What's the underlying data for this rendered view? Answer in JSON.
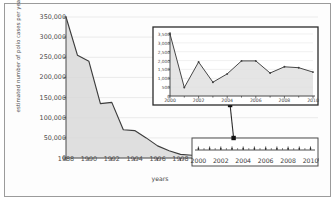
{
  "chart_data": {
    "type": "area",
    "title": "",
    "xlabel": "years",
    "ylabel": "estimated number of polio cases per year",
    "grid": true,
    "legend": "none",
    "xlim": [
      1988,
      2010
    ],
    "ylim": [
      0,
      350000
    ],
    "y_ticks": [
      "0",
      "50,000",
      "100,000",
      "150,000",
      "200,000",
      "250,000",
      "300,000",
      "350,000"
    ],
    "y_tick_values": [
      0,
      50000,
      100000,
      150000,
      200000,
      250000,
      300000,
      350000
    ],
    "x_ticks": [
      "1988",
      "1990",
      "1992",
      "1994",
      "1996",
      "1998",
      "2000",
      "2002",
      "2004",
      "2006",
      "2008",
      "2010"
    ],
    "x_tick_values": [
      1988,
      1990,
      1992,
      1994,
      1996,
      1998,
      2000,
      2002,
      2004,
      2006,
      2008,
      2010
    ],
    "x": [
      1988,
      1989,
      1990,
      1991,
      1992,
      1993,
      1994,
      1995,
      1996,
      1997,
      1998,
      1999,
      2000,
      2001,
      2002,
      2003,
      2004,
      2005,
      2006,
      2007,
      2008,
      2009,
      2010
    ],
    "values": [
      350000,
      255000,
      240000,
      135000,
      138000,
      70000,
      68000,
      50000,
      30000,
      18000,
      9000,
      7000,
      3500,
      480,
      1920,
      780,
      1250,
      1980,
      1980,
      1300,
      1650,
      1600,
      1350
    ],
    "series_color": "#3d3d3d",
    "fill_color": "#d9d9d9"
  },
  "inset_chart": {
    "type": "area",
    "title": "",
    "xlabel": "",
    "ylabel": "",
    "grid": true,
    "legend": "none",
    "xlim": [
      2000,
      2010
    ],
    "ylim": [
      0,
      3500
    ],
    "y_ticks": [
      "0",
      "500",
      "1,000",
      "1,500",
      "2,000",
      "2,500",
      "3,000",
      "3,500"
    ],
    "y_tick_values": [
      0,
      500,
      1000,
      1500,
      2000,
      2500,
      3000,
      3500
    ],
    "x_ticks": [
      "2000",
      "2002",
      "2004",
      "2006",
      "2008",
      "2010"
    ],
    "x_tick_values": [
      2000,
      2002,
      2004,
      2006,
      2008,
      2010
    ],
    "x": [
      2000,
      2001,
      2002,
      2003,
      2004,
      2005,
      2006,
      2007,
      2008,
      2009,
      2010
    ],
    "values": [
      3500,
      480,
      1920,
      780,
      1250,
      1980,
      1980,
      1300,
      1650,
      1600,
      1350
    ],
    "series_color": "#3d3d3d",
    "fill_color": "#dedede"
  },
  "callout": {
    "label": "",
    "x_ticks": [
      "2000",
      "2002",
      "2004",
      "2006",
      "2008",
      "2010"
    ],
    "x_tick_values": [
      2000,
      2002,
      2004,
      2006,
      2008,
      2010
    ],
    "range_start": 1999,
    "range_end": 2010
  },
  "colors": {
    "frame": "#9b9b9b",
    "axis": "#4a4a4a",
    "grid": "#e2e2e2",
    "line": "#3d3d3d",
    "fill": "#d9d9d9",
    "inset_border": "#2b2b2b",
    "callout_border": "#4d4d4d",
    "text": "#4a4a4a"
  }
}
